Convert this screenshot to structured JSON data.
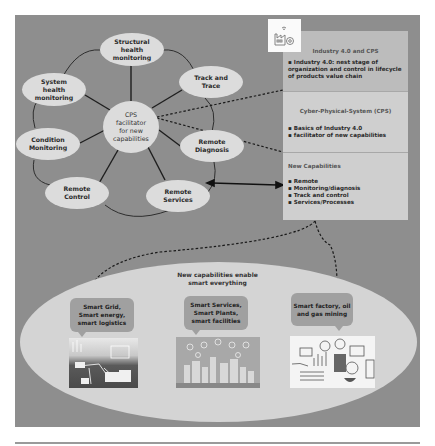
{
  "diagram": {
    "center_node": "CPS\nfacilitator\nfor new\ncapabilities",
    "nodes": [
      {
        "label": "Structural\nhealth\nmonitoring"
      },
      {
        "label": "Track and\nTrace"
      },
      {
        "label": "Remote\nDiagnosis"
      },
      {
        "label": "Remote\nServices"
      },
      {
        "label": "Remote\nControl"
      },
      {
        "label": "Condition\nMonitoring"
      },
      {
        "label": "System\nhealth\nmonitoring"
      }
    ],
    "icon": "smart-factory-icon",
    "info_boxes": [
      {
        "title": "Industry 4.0 and CPS",
        "bullets": [
          "Industry 4.0: nest stage of organization and control in lifecycle of products value chain"
        ]
      },
      {
        "title": "Cyber-Physical-System (CPS)",
        "bullets": [
          "Basics of Industry 4.0",
          "facilitator of new capabilities"
        ]
      },
      {
        "title": "New Capabilities",
        "bullets": [
          "Remote",
          "Monitoring/diagnosis",
          "Track and control",
          "Services/Processes"
        ]
      }
    ],
    "bottom": {
      "title": "New capabilities enable\nsmart everything",
      "bubbles": [
        {
          "label": "Smart Grid,\nSmart energy,\nsmart logistics",
          "image": "smart-grid-illustration"
        },
        {
          "label": "Smart Services,\nSmart Plants,\nsmart facilities",
          "image": "smart-city-illustration"
        },
        {
          "label": "Smart factory, oil\nand gas mining",
          "image": "smart-factory-illustration"
        }
      ]
    },
    "colors": {
      "background_panel": "#8e8e8e",
      "node_fill": "#dcdcdc",
      "box_fill": "#cfcfcf",
      "ellipse_fill": "#d4d4d4",
      "bubble_fill": "#a0a0a0"
    }
  }
}
